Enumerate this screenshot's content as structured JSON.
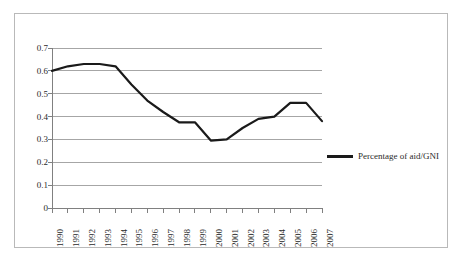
{
  "chart_data": {
    "type": "line",
    "title": "",
    "subtitle": "",
    "xlabel": "",
    "ylabel": "",
    "categories": [
      "1990",
      "1991",
      "1992",
      "1993",
      "1994",
      "1995",
      "1996",
      "1997",
      "1998",
      "1999",
      "2000",
      "2001",
      "2002",
      "2003",
      "2004",
      "2005",
      "2006",
      "2007"
    ],
    "series": [
      {
        "name": "Percentage of aid/GNI",
        "color": "#1a1a1a",
        "values": [
          0.6,
          0.62,
          0.63,
          0.63,
          0.62,
          0.54,
          0.47,
          0.42,
          0.375,
          0.375,
          0.295,
          0.3,
          0.35,
          0.39,
          0.4,
          0.46,
          0.46,
          0.38
        ]
      }
    ],
    "ylim": [
      0,
      0.7
    ],
    "y_ticks": [
      "0.7",
      "0.6",
      "0.5",
      "0.4",
      "0.3",
      "0.2",
      "0.1",
      "0"
    ],
    "y_tick_values": [
      0.7,
      0.6,
      0.5,
      0.4,
      0.3,
      0.2,
      0.1,
      0
    ],
    "grid": true,
    "grid_color": "#a6a6a6",
    "legend_position": "right",
    "axis_color": "#808080",
    "x_tick_rotation": -90
  },
  "legend": {
    "entries": [
      {
        "label": "Percentage of aid/GNI"
      }
    ]
  }
}
